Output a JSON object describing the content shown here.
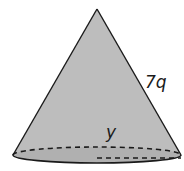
{
  "figure": {
    "shape": "cone",
    "labels": {
      "slant_height": "7q",
      "radius": "y"
    },
    "colors": {
      "fill": "#bdbdbd",
      "base_fill": "#b0b0b0",
      "stroke": "#1a1a1a",
      "background": "#ffffff"
    }
  }
}
